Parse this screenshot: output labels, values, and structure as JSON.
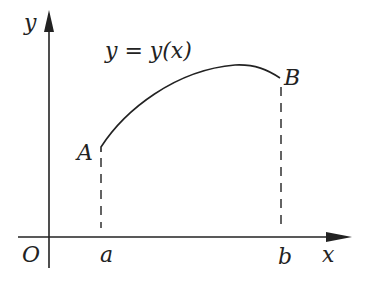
{
  "diagram": {
    "axes": {
      "x_label": "x",
      "y_label": "y",
      "origin_label": "O"
    },
    "curve": {
      "equation_label": "y = y(x)",
      "start_point_label": "A",
      "end_point_label": "B"
    },
    "x_ticks": {
      "a_label": "a",
      "b_label": "b"
    },
    "colors": {
      "stroke": "#222222",
      "background": "#ffffff"
    }
  }
}
